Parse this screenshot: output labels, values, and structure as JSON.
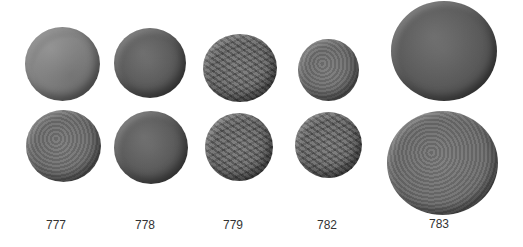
{
  "figure": {
    "background_color": "#ffffff",
    "coin_tone": "#6e6e6e",
    "columns": [
      {
        "catalog_number": "777",
        "obverse": "worn head, smooth bronze",
        "reverse": "worn prow / galley"
      },
      {
        "catalog_number": "778",
        "obverse": "worn head",
        "reverse": "galley prow with lines"
      },
      {
        "catalog_number": "779",
        "obverse": "rough textured head",
        "reverse": "horse / animal to right"
      },
      {
        "catalog_number": "782",
        "obverse": "small head",
        "reverse": "animal to right"
      },
      {
        "catalog_number": "783",
        "obverse": "large worn bronze",
        "reverse": "large worn bronze, prow"
      }
    ]
  }
}
